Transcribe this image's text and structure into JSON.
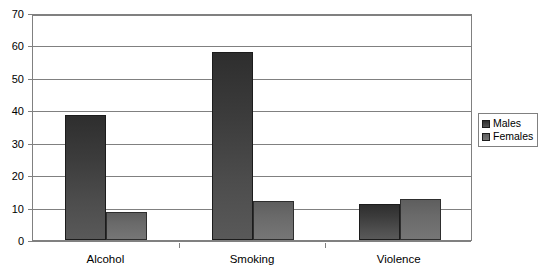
{
  "chart_data": {
    "type": "bar",
    "title": "",
    "subtitle": "",
    "xlabel": "",
    "ylabel": "",
    "categories": [
      "Alcohol",
      "Smoking",
      "Violence"
    ],
    "series": [
      {
        "name": "Males",
        "color": "#3c3c3c",
        "values": [
          38.5,
          58,
          11
        ]
      },
      {
        "name": "Females",
        "color": "#6a6a6a",
        "values": [
          8.5,
          12,
          12.5
        ]
      }
    ],
    "ylim": [
      0,
      70
    ],
    "yticks": [
      0,
      10,
      20,
      30,
      40,
      50,
      60,
      70
    ],
    "ytick_labels": [
      "0",
      "10",
      "20",
      "30",
      "40",
      "50",
      "60",
      "70"
    ],
    "grid": "horizontal",
    "legend": {
      "position": "right",
      "entries": [
        "Males",
        "Females"
      ]
    },
    "plot_border": true,
    "background": "#ffffff"
  }
}
